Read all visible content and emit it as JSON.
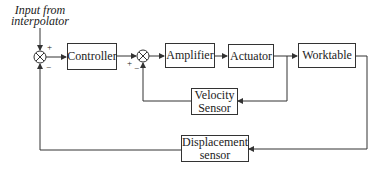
{
  "diagram": {
    "input_label_line1": "Input from",
    "input_label_line2": "interpolator",
    "blocks": {
      "controller": "Controller",
      "amplifier": "Amplifier",
      "actuator": "Actuator",
      "worktable": "Worktable",
      "velocity_sensor_line1": "Velocity",
      "velocity_sensor_line2": "Sensor",
      "displacement_sensor_line1": "Displacement",
      "displacement_sensor_line2": "sensor"
    },
    "summing_junctions": [
      {
        "plus": "+",
        "minus": "−"
      },
      {
        "plus": "+",
        "minus": "−"
      }
    ],
    "line_color": "#333333"
  }
}
